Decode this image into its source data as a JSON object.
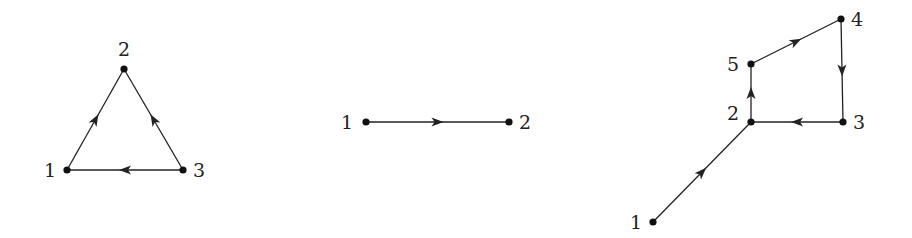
{
  "graphs": [
    {
      "id": "triangle",
      "nodes": [
        {
          "id": "1",
          "label": "1",
          "x": 67,
          "y": 170,
          "lx": 44,
          "ly": 177
        },
        {
          "id": "2",
          "label": "2",
          "x": 124,
          "y": 69,
          "lx": 118,
          "ly": 56
        },
        {
          "id": "3",
          "label": "3",
          "x": 183,
          "y": 170,
          "lx": 193,
          "ly": 177
        }
      ],
      "edges": [
        {
          "from": "1",
          "to": "2"
        },
        {
          "from": "3",
          "to": "2"
        },
        {
          "from": "3",
          "to": "1"
        }
      ]
    },
    {
      "id": "line",
      "nodes": [
        {
          "id": "1",
          "label": "1",
          "x": 366,
          "y": 122,
          "lx": 341,
          "ly": 129
        },
        {
          "id": "2",
          "label": "2",
          "x": 509,
          "y": 122,
          "lx": 519,
          "ly": 129
        }
      ],
      "edges": [
        {
          "from": "1",
          "to": "2"
        }
      ]
    },
    {
      "id": "tailed-cycle",
      "nodes": [
        {
          "id": "1",
          "label": "1",
          "x": 653,
          "y": 222,
          "lx": 630,
          "ly": 229
        },
        {
          "id": "2",
          "label": "2",
          "x": 751,
          "y": 122,
          "lx": 727,
          "ly": 120
        },
        {
          "id": "3",
          "label": "3",
          "x": 843,
          "y": 122,
          "lx": 853,
          "ly": 129
        },
        {
          "id": "4",
          "label": "4",
          "x": 841,
          "y": 19,
          "lx": 851,
          "ly": 26
        },
        {
          "id": "5",
          "label": "5",
          "x": 751,
          "y": 64,
          "lx": 727,
          "ly": 71
        }
      ],
      "edges": [
        {
          "from": "1",
          "to": "2"
        },
        {
          "from": "2",
          "to": "5"
        },
        {
          "from": "5",
          "to": "4"
        },
        {
          "from": "4",
          "to": "3"
        },
        {
          "from": "3",
          "to": "2"
        }
      ]
    }
  ]
}
